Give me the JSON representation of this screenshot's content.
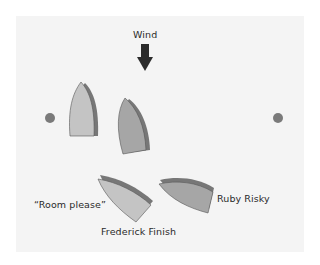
{
  "diagram": {
    "wind_label": "Wind",
    "labels": {
      "room_please": "“Room please”",
      "ruby_risky": "Ruby Risky",
      "frederick_finish": "Frederick Finish"
    },
    "colors": {
      "background": "#f4f4f4",
      "boat_light": "#c4c4c4",
      "boat_dark": "#a6a6a6",
      "boat_shadow": "#777777",
      "arrow": "#2b2b2b",
      "mark": "#7a7a7a"
    },
    "marks": [
      {
        "name": "left-mark",
        "x": 50,
        "y": 118
      },
      {
        "name": "right-mark",
        "x": 278,
        "y": 118
      }
    ],
    "boats": [
      {
        "name": "boat-upper-left",
        "shade": "light"
      },
      {
        "name": "boat-upper-center",
        "shade": "dark"
      },
      {
        "name": "boat-frederick-finish",
        "shade": "light"
      },
      {
        "name": "boat-ruby-risky",
        "shade": "dark"
      }
    ]
  }
}
